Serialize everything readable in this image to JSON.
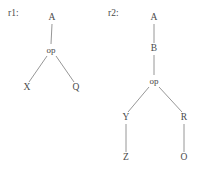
{
  "figure": {
    "background_color": "#ffffff",
    "ink_color": "#4a4a4a",
    "edge_color": "#8a8a8a"
  },
  "trees": [
    {
      "id": "r1",
      "label": "r1:",
      "label_x": 8,
      "label_y": 14,
      "nodes": [
        {
          "id": "r1-a",
          "text": "A",
          "x": 52,
          "y": 18
        },
        {
          "id": "r1-op",
          "text": "op",
          "x": 51,
          "y": 50
        },
        {
          "id": "r1-x",
          "text": "X",
          "x": 27,
          "y": 88
        },
        {
          "id": "r1-q",
          "text": "Q",
          "x": 76,
          "y": 88
        }
      ],
      "edges": [
        {
          "from": "r1-a",
          "to": "r1-op",
          "x1": 52,
          "y1": 24,
          "x2": 51,
          "y2": 44
        },
        {
          "from": "r1-op",
          "to": "r1-x",
          "x1": 47,
          "y1": 56,
          "x2": 29,
          "y2": 82
        },
        {
          "from": "r1-op",
          "to": "r1-q",
          "x1": 56,
          "y1": 56,
          "x2": 74,
          "y2": 82
        }
      ]
    },
    {
      "id": "r2",
      "label": "r2:",
      "label_x": 108,
      "label_y": 14,
      "nodes": [
        {
          "id": "r2-a",
          "text": "A",
          "x": 154,
          "y": 18
        },
        {
          "id": "r2-b",
          "text": "B",
          "x": 154,
          "y": 49
        },
        {
          "id": "r2-op",
          "text": "op",
          "x": 154,
          "y": 81
        },
        {
          "id": "r2-y",
          "text": "Y",
          "x": 126,
          "y": 118
        },
        {
          "id": "r2-r",
          "text": "R",
          "x": 184,
          "y": 118
        },
        {
          "id": "r2-z",
          "text": "Z",
          "x": 126,
          "y": 158
        },
        {
          "id": "r2-o",
          "text": "O",
          "x": 184,
          "y": 158
        }
      ],
      "edges": [
        {
          "from": "r2-a",
          "to": "r2-b",
          "x1": 154,
          "y1": 24,
          "x2": 154,
          "y2": 43
        },
        {
          "from": "r2-b",
          "to": "r2-op",
          "x1": 154,
          "y1": 55,
          "x2": 154,
          "y2": 75
        },
        {
          "from": "r2-op",
          "to": "r2-y",
          "x1": 149,
          "y1": 87,
          "x2": 128,
          "y2": 112
        },
        {
          "from": "r2-op",
          "to": "r2-r",
          "x1": 159,
          "y1": 87,
          "x2": 182,
          "y2": 112
        },
        {
          "from": "r2-y",
          "to": "r2-z",
          "x1": 126,
          "y1": 124,
          "x2": 126,
          "y2": 152
        },
        {
          "from": "r2-r",
          "to": "r2-o",
          "x1": 184,
          "y1": 124,
          "x2": 184,
          "y2": 152
        }
      ]
    }
  ]
}
